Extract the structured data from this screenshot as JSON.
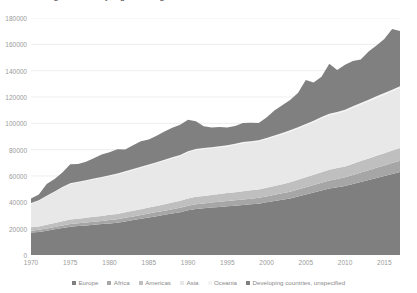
{
  "chart": {
    "title": "Migrant stock by region of origin",
    "plot_bg": "#ffffff",
    "gridline_color": "#e6e6e6",
    "axis_text_color": "#9a9a9a"
  },
  "legend": {
    "position": "bottom",
    "items": [
      {
        "label": "Europe",
        "color": "#7f7f7f"
      },
      {
        "label": "Africa",
        "color": "#a6a6a6"
      },
      {
        "label": "Americas",
        "color": "#bfbfbf"
      },
      {
        "label": "Asia",
        "color": "#e8e8e8"
      },
      {
        "label": "Oceania",
        "color": "#f4f4f4"
      },
      {
        "label": "Developing countries, unspecified",
        "color": "#808080"
      }
    ]
  },
  "chart_data": {
    "type": "area",
    "title": "Migrant stock by region of origin",
    "xlabel": "",
    "ylabel": "",
    "stacked": true,
    "grid": true,
    "xlim": [
      1970,
      2017
    ],
    "ylim": [
      0,
      180000
    ],
    "ytick_values": [
      0,
      20000,
      40000,
      60000,
      80000,
      100000,
      120000,
      140000,
      160000,
      180000
    ],
    "ytick_labels": [
      "0",
      "20000",
      "40000",
      "60000",
      "80000",
      "100000",
      "120000",
      "140000",
      "160000",
      "180000"
    ],
    "xtick_values": [
      1970,
      1975,
      1980,
      1985,
      1990,
      1995,
      2000,
      2005,
      2010,
      2015
    ],
    "xtick_labels": [
      "1970",
      "1975",
      "1980",
      "1985",
      "1990",
      "1995",
      "2000",
      "2005",
      "2010",
      "2015"
    ],
    "x": [
      1970,
      1971,
      1972,
      1973,
      1974,
      1975,
      1976,
      1977,
      1978,
      1979,
      1980,
      1981,
      1982,
      1983,
      1984,
      1985,
      1986,
      1987,
      1988,
      1989,
      1990,
      1991,
      1992,
      1993,
      1994,
      1995,
      1996,
      1997,
      1998,
      1999,
      2000,
      2001,
      2002,
      2003,
      2004,
      2005,
      2006,
      2007,
      2008,
      2009,
      2010,
      2011,
      2012,
      2013,
      2014,
      2015,
      2016,
      2017
    ],
    "series": [
      {
        "name": "Europe",
        "color": "#7f7f7f",
        "values": [
          17000,
          17500,
          18500,
          19500,
          20500,
          21500,
          22000,
          22500,
          23000,
          23500,
          24000,
          24500,
          25500,
          26500,
          27500,
          28500,
          29500,
          30500,
          31500,
          32500,
          34000,
          35000,
          35500,
          36000,
          36500,
          37000,
          37500,
          38000,
          38500,
          39000,
          40000,
          41000,
          42000,
          43000,
          44500,
          46000,
          47500,
          49000,
          50500,
          51500,
          52500,
          54000,
          55500,
          57000,
          58500,
          60000,
          61500,
          63000
        ]
      },
      {
        "name": "Africa",
        "color": "#a6a6a6",
        "values": [
          1500,
          1600,
          1700,
          1800,
          1900,
          2000,
          2100,
          2200,
          2300,
          2400,
          2500,
          2600,
          2700,
          2800,
          2900,
          3000,
          3100,
          3200,
          3300,
          3400,
          3500,
          3600,
          3700,
          3800,
          3900,
          4000,
          4100,
          4200,
          4300,
          4400,
          4500,
          4700,
          4900,
          5100,
          5300,
          5500,
          5700,
          5900,
          6100,
          6300,
          6500,
          6800,
          7100,
          7400,
          7700,
          8000,
          8300,
          8600
        ]
      },
      {
        "name": "Americas",
        "color": "#bfbfbf",
        "values": [
          2500,
          2600,
          2800,
          3000,
          3200,
          3400,
          3500,
          3600,
          3700,
          3800,
          4000,
          4100,
          4200,
          4300,
          4400,
          4500,
          4700,
          4900,
          5100,
          5300,
          5500,
          5600,
          5700,
          5800,
          5900,
          6000,
          6100,
          6200,
          6300,
          6400,
          6500,
          6700,
          6900,
          7100,
          7300,
          7500,
          7700,
          7900,
          8100,
          8200,
          8300,
          8500,
          8700,
          8900,
          9100,
          9300,
          9500,
          9700
        ]
      },
      {
        "name": "Asia",
        "color": "#e8e8e8",
        "values": [
          18000,
          19500,
          21500,
          23500,
          25500,
          27000,
          27500,
          28000,
          28500,
          29000,
          29500,
          30000,
          30500,
          31000,
          31500,
          32000,
          32500,
          33000,
          33500,
          34000,
          35000,
          35500,
          35500,
          35500,
          35500,
          35500,
          36000,
          36500,
          36500,
          36500,
          37000,
          37500,
          38000,
          38500,
          39000,
          39500,
          40000,
          41000,
          41500,
          41500,
          42000,
          42500,
          43000,
          43500,
          44000,
          44500,
          45000,
          45500
        ]
      },
      {
        "name": "Oceania",
        "color": "#f4f4f4",
        "values": [
          400,
          420,
          440,
          460,
          480,
          500,
          520,
          540,
          560,
          580,
          600,
          620,
          640,
          660,
          680,
          700,
          720,
          740,
          760,
          780,
          800,
          810,
          820,
          830,
          840,
          850,
          860,
          870,
          880,
          890,
          900,
          920,
          940,
          960,
          980,
          1000,
          1020,
          1040,
          1060,
          1080,
          1100,
          1130,
          1160,
          1190,
          1220,
          1250,
          1280,
          1310
        ]
      },
      {
        "name": "Developing countries, unspecified",
        "color": "#808080",
        "values": [
          3600,
          4400,
          9000,
          9500,
          11000,
          14500,
          13500,
          14000,
          15500,
          17000,
          17500,
          18500,
          16500,
          18000,
          19500,
          19000,
          20000,
          21500,
          22500,
          23000,
          24000,
          21000,
          16500,
          15000,
          14500,
          13500,
          13500,
          14500,
          14000,
          13000,
          15500,
          19000,
          21000,
          23000,
          26000,
          33500,
          29000,
          30500,
          38000,
          32000,
          34000,
          34500,
          33000,
          36500,
          38500,
          41000,
          46000,
          42000
        ]
      }
    ]
  }
}
